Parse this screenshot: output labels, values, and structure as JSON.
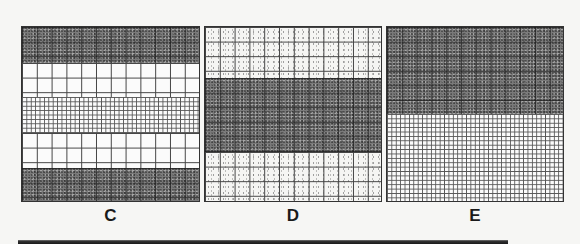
{
  "figure": {
    "panels": [
      {
        "label": "C",
        "bands": [
          {
            "pattern": "dark-stippled-coarse-grid",
            "top": 0,
            "height": 36
          },
          {
            "pattern": "white-coarse-grid",
            "top": 36,
            "height": 34
          },
          {
            "pattern": "fine-mesh",
            "top": 70,
            "height": 36
          },
          {
            "pattern": "white-coarse-grid",
            "top": 106,
            "height": 35
          },
          {
            "pattern": "dark-stippled-coarse-grid",
            "top": 141,
            "height": 35
          }
        ]
      },
      {
        "label": "D",
        "bands": [
          {
            "pattern": "light-dotted-coarse-grid",
            "top": 0,
            "height": 51
          },
          {
            "pattern": "dark-stippled-coarse-grid",
            "top": 51,
            "height": 74
          },
          {
            "pattern": "light-dotted-coarse-grid",
            "top": 125,
            "height": 51
          }
        ]
      },
      {
        "label": "E",
        "bands": [
          {
            "pattern": "dark-stippled-coarse-grid",
            "top": 0,
            "height": 87
          },
          {
            "pattern": "fine-mesh",
            "top": 87,
            "height": 89
          }
        ]
      }
    ],
    "colors": {
      "background": "#f6f6f4",
      "grid_line": "#444444",
      "dark_fill": "#7a7a7a",
      "label_text": "#1a1a1a"
    }
  }
}
